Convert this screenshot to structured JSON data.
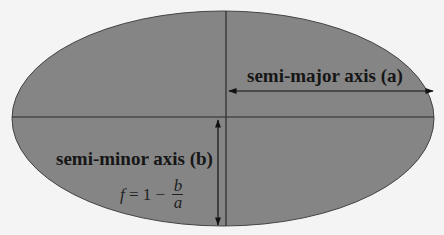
{
  "diagram": {
    "colors": {
      "fill": "#858585",
      "stroke": "#3a3a3a",
      "background": "#f4f4f4",
      "text": "#161616"
    },
    "labels": {
      "semi_major": "semi-major axis (a)",
      "semi_minor": "semi-minor axis (b)"
    },
    "formula": {
      "lhs": "f",
      "equals": " = ",
      "one": "1",
      "minus": " − ",
      "numerator": "b",
      "denominator": "a"
    }
  }
}
